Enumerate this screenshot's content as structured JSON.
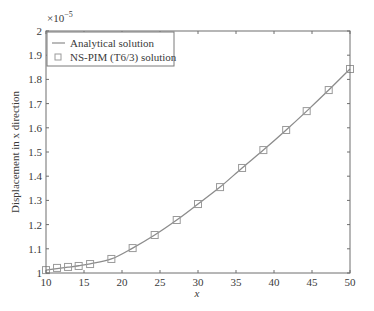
{
  "chart_data": {
    "type": "line",
    "title": "",
    "xlabel": "x",
    "ylabel": "Displacement in x direction",
    "y_exponent_label": "×10",
    "y_exponent_power": "−5",
    "xlim": [
      10,
      50
    ],
    "ylim": [
      1.0,
      2.0
    ],
    "y_scale_factor": 1e-05,
    "grid": false,
    "legend_position": "upper-left",
    "x_ticks": [
      10,
      15,
      20,
      25,
      30,
      35,
      40,
      45,
      50
    ],
    "x_tick_labels": [
      "10",
      "15",
      "20",
      "25",
      "30",
      "35",
      "40",
      "45",
      "50"
    ],
    "y_ticks": [
      1.0,
      1.1,
      1.2,
      1.3,
      1.4,
      1.5,
      1.6,
      1.7,
      1.8,
      1.9,
      2.0
    ],
    "y_tick_labels": [
      "1",
      "1.1",
      "1.2",
      "1.3",
      "1.4",
      "1.5",
      "1.6",
      "1.7",
      "1.8",
      "1.9",
      "2"
    ],
    "series": [
      {
        "name": "Analytical solution",
        "style": "line",
        "color": "#8c8c8c",
        "x": [
          10,
          11.45,
          12.9,
          14.3,
          15.8,
          18.6,
          21.4,
          24.3,
          27.2,
          30.0,
          32.9,
          35.8,
          38.6,
          41.6,
          44.3,
          47.2,
          50.0
        ],
        "y": [
          1.012,
          1.018,
          1.024,
          1.03,
          1.038,
          1.058,
          1.103,
          1.157,
          1.219,
          1.285,
          1.355,
          1.434,
          1.508,
          1.591,
          1.669,
          1.756,
          1.843
        ]
      },
      {
        "name": "NS-PIM (T6/3) solution",
        "style": "square-markers",
        "color": "#9a9a9a",
        "x": [
          10,
          11.45,
          12.9,
          14.3,
          15.8,
          18.6,
          21.4,
          24.3,
          27.2,
          30.0,
          32.9,
          35.8,
          38.6,
          41.6,
          44.3,
          47.2,
          50.0
        ],
        "y": [
          1.012,
          1.021,
          1.025,
          1.029,
          1.037,
          1.058,
          1.103,
          1.157,
          1.219,
          1.285,
          1.355,
          1.434,
          1.508,
          1.591,
          1.669,
          1.756,
          1.843
        ]
      }
    ]
  }
}
